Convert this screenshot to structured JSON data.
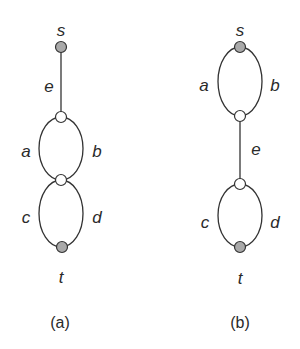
{
  "figure": {
    "panels": [
      {
        "id": "a",
        "caption": "(a)",
        "nodes": [
          {
            "id": "s",
            "label": "s",
            "type": "terminal",
            "color": "#a9a9a9"
          },
          {
            "id": "u1",
            "label": "",
            "type": "internal",
            "color": "#ffffff"
          },
          {
            "id": "u2",
            "label": "",
            "type": "internal",
            "color": "#ffffff"
          },
          {
            "id": "t",
            "label": "t",
            "type": "terminal",
            "color": "#a9a9a9"
          }
        ],
        "edges": [
          {
            "label": "e",
            "from": "s",
            "to": "u1"
          },
          {
            "label": "a",
            "from": "u1",
            "to": "u2"
          },
          {
            "label": "b",
            "from": "u1",
            "to": "u2"
          },
          {
            "label": "c",
            "from": "u2",
            "to": "t"
          },
          {
            "label": "d",
            "from": "u2",
            "to": "t"
          }
        ]
      },
      {
        "id": "b",
        "caption": "(b)",
        "nodes": [
          {
            "id": "s",
            "label": "s",
            "type": "terminal",
            "color": "#a9a9a9"
          },
          {
            "id": "v1",
            "label": "",
            "type": "internal",
            "color": "#ffffff"
          },
          {
            "id": "v2",
            "label": "",
            "type": "internal",
            "color": "#ffffff"
          },
          {
            "id": "t",
            "label": "t",
            "type": "terminal",
            "color": "#a9a9a9"
          }
        ],
        "edges": [
          {
            "label": "a",
            "from": "s",
            "to": "v1"
          },
          {
            "label": "b",
            "from": "s",
            "to": "v1"
          },
          {
            "label": "e",
            "from": "v1",
            "to": "v2"
          },
          {
            "label": "c",
            "from": "v2",
            "to": "t"
          },
          {
            "label": "d",
            "from": "v2",
            "to": "t"
          }
        ]
      }
    ]
  }
}
